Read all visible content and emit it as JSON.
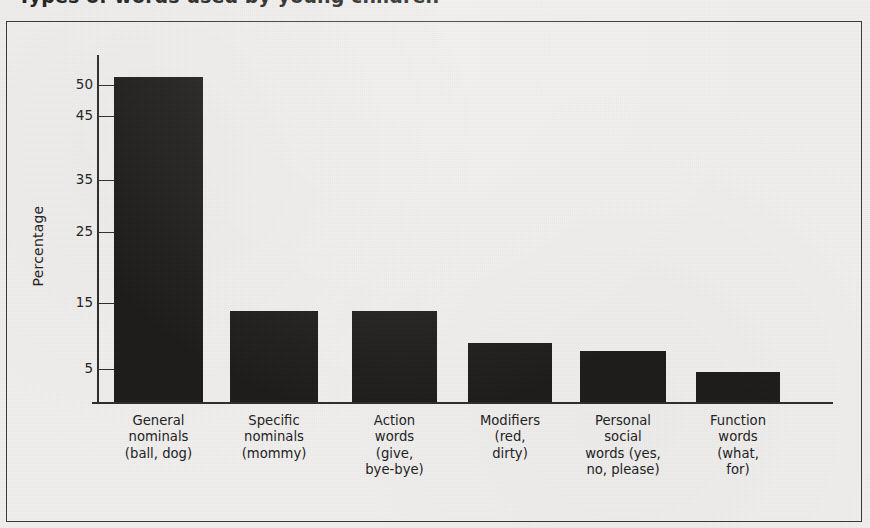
{
  "figure": {
    "title_cropped": "Types of words used by young children",
    "frame": {
      "border_color": "#3a3936"
    },
    "background_color": "#f1f0ee"
  },
  "chart_data": {
    "type": "bar",
    "title": "Types of words used by young children",
    "xlabel": "",
    "ylabel": "Percentage",
    "grid": false,
    "legend": "none",
    "bar_color": "#1d1c1a",
    "categories": [
      "General nominals (ball, dog)",
      "Specific nominals (mommy)",
      "Action words (give, bye-bye)",
      "Modifiers (red, dirty)",
      "Personal social words (yes, no, please)",
      "Function words (what, for)"
    ],
    "values": [
      50.5,
      14.5,
      14.5,
      9,
      8,
      4.5
    ],
    "ylim": [
      0,
      52
    ],
    "ytick_labels": [
      "50",
      "45",
      "35",
      "25",
      "15",
      "5"
    ],
    "ytick_values": [
      50,
      45,
      35,
      25,
      15,
      5
    ],
    "note": "y-axis tick spacing is non-linear as printed: 50 and 45 sit close together, remaining ticks step by 10"
  },
  "axis": {
    "y_label": "Percentage",
    "ticks": [
      {
        "label": "50",
        "value": 50,
        "y": 85
      },
      {
        "label": "45",
        "value": 45,
        "y": 116
      },
      {
        "label": "35",
        "value": 35,
        "y": 180
      },
      {
        "label": "25",
        "value": 25,
        "y": 232
      },
      {
        "label": "15",
        "value": 15,
        "y": 303
      },
      {
        "label": "5",
        "value": 5,
        "y": 369
      }
    ]
  },
  "bars": [
    {
      "name": "general-nominals",
      "label": "General\nnominals\n(ball, dog)",
      "value": 50.5,
      "x": 114,
      "width": 89,
      "top": 77
    },
    {
      "name": "specific-nominals",
      "label": "Specific\nnominals\n(mommy)",
      "value": 14.5,
      "x": 230,
      "width": 88,
      "top": 311
    },
    {
      "name": "action-words",
      "label": "Action\nwords\n(give,\nbye-bye)",
      "value": 14.5,
      "x": 352,
      "width": 85,
      "top": 311
    },
    {
      "name": "modifiers",
      "label": "Modifiers\n(red,\ndirty)",
      "value": 9,
      "x": 468,
      "width": 84,
      "top": 343
    },
    {
      "name": "personal-social-words",
      "label": "Personal\nsocial\nwords (yes,\nno, please)",
      "value": 8,
      "x": 580,
      "width": 86,
      "top": 351
    },
    {
      "name": "function-words",
      "label": "Function\nwords\n(what,\nfor)",
      "value": 4.5,
      "x": 696,
      "width": 84,
      "top": 372
    }
  ]
}
